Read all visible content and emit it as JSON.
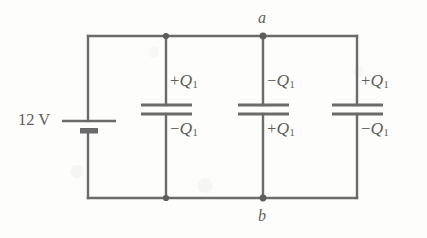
{
  "diagram": {
    "background_color": "#fdfdfb",
    "ink_color": "#6b6b6b",
    "source": {
      "label": "12 V",
      "type": "battery"
    },
    "nodes": {
      "top": "a",
      "bottom": "b"
    },
    "capacitors": [
      {
        "id": "c1",
        "top_charge": {
          "sign": "+",
          "symbol": "Q",
          "subscript": "1"
        },
        "bottom_charge": {
          "sign": "−",
          "symbol": "Q",
          "subscript": "1"
        }
      },
      {
        "id": "c2",
        "top_charge": {
          "sign": "−",
          "symbol": "Q",
          "subscript": "1"
        },
        "bottom_charge": {
          "sign": "+",
          "symbol": "Q",
          "subscript": "1"
        }
      },
      {
        "id": "c3",
        "top_charge": {
          "sign": "+",
          "symbol": "Q",
          "subscript": "1"
        },
        "bottom_charge": {
          "sign": "−",
          "symbol": "Q",
          "subscript": "1"
        }
      }
    ]
  }
}
